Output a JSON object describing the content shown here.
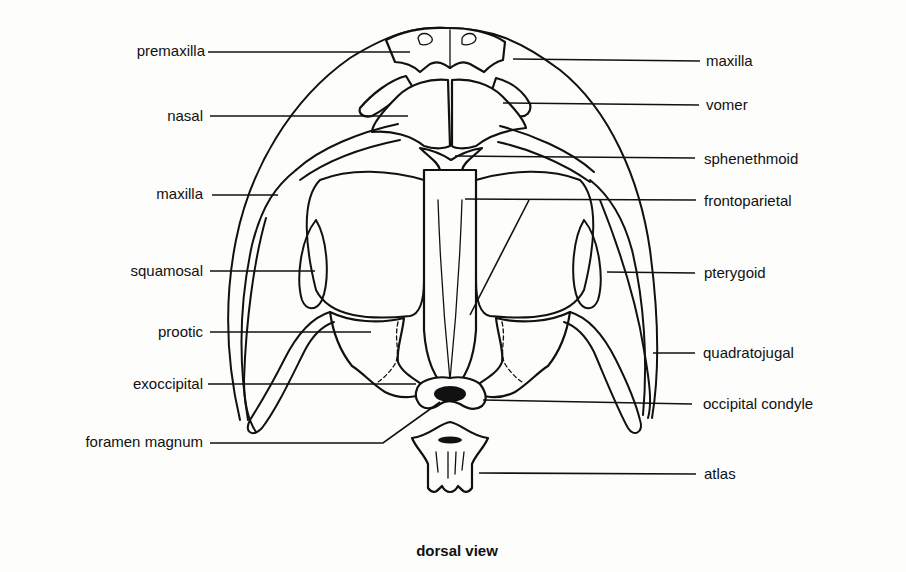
{
  "figure": {
    "title": "dorsal view",
    "background": "#fdfdfb",
    "ink": "#111111"
  },
  "labels": {
    "left": [
      {
        "id": "premaxilla",
        "text": "premaxilla",
        "x": 205,
        "y": 56,
        "line": [
          [
            208,
            52
          ],
          [
            410,
            52
          ]
        ]
      },
      {
        "id": "nasal",
        "text": "nasal",
        "x": 203,
        "y": 121,
        "line": [
          [
            210,
            116
          ],
          [
            408,
            116
          ]
        ]
      },
      {
        "id": "maxilla-left",
        "text": "maxilla",
        "x": 203,
        "y": 199,
        "line": [
          [
            212,
            195
          ],
          [
            278,
            195
          ]
        ]
      },
      {
        "id": "squamosal",
        "text": "squamosal",
        "x": 203,
        "y": 276,
        "line": [
          [
            210,
            271
          ],
          [
            315,
            271
          ]
        ]
      },
      {
        "id": "prootic",
        "text": "prootic",
        "x": 203,
        "y": 337,
        "line": [
          [
            210,
            332
          ],
          [
            371,
            332
          ]
        ]
      },
      {
        "id": "exoccipital",
        "text": "exoccipital",
        "x": 203,
        "y": 389,
        "line": [
          [
            208,
            384
          ],
          [
            416,
            384
          ]
        ]
      },
      {
        "id": "foramen-magnum",
        "text": "foramen magnum",
        "x": 203,
        "y": 447,
        "line": [
          [
            210,
            443
          ],
          [
            383,
            443
          ],
          [
            440,
            402
          ]
        ]
      }
    ],
    "right": [
      {
        "id": "maxilla-right",
        "text": "maxilla",
        "x": 706,
        "y": 66,
        "line": [
          [
            513,
            59
          ],
          [
            700,
            61
          ]
        ]
      },
      {
        "id": "vomer",
        "text": "vomer",
        "x": 706,
        "y": 110,
        "line": [
          [
            503,
            103
          ],
          [
            699,
            105
          ]
        ]
      },
      {
        "id": "sphenethmoid",
        "text": "sphenethmoid",
        "x": 704,
        "y": 164,
        "line": [
          [
            455,
            156
          ],
          [
            695,
            158
          ]
        ]
      },
      {
        "id": "frontoparietal",
        "text": "frontoparietal",
        "x": 704,
        "y": 206,
        "line": [
          [
            465,
            199
          ],
          [
            696,
            200
          ]
        ],
        "extra": [
          [
            529,
            200
          ],
          [
            470,
            315
          ]
        ]
      },
      {
        "id": "pterygoid",
        "text": "pterygoid",
        "x": 704,
        "y": 278,
        "line": [
          [
            607,
            272
          ],
          [
            695,
            273
          ]
        ]
      },
      {
        "id": "quadratojugal",
        "text": "quadratojugal",
        "x": 703,
        "y": 358,
        "line": [
          [
            653,
            353
          ],
          [
            695,
            353
          ]
        ]
      },
      {
        "id": "occipital-condyle",
        "text": "occipital condyle",
        "x": 703,
        "y": 409,
        "line": [
          [
            483,
            400
          ],
          [
            692,
            404
          ]
        ]
      },
      {
        "id": "atlas",
        "text": "atlas",
        "x": 704,
        "y": 479,
        "line": [
          [
            479,
            473
          ],
          [
            696,
            474
          ]
        ]
      }
    ]
  },
  "title_position": {
    "x": 457,
    "y": 556
  }
}
